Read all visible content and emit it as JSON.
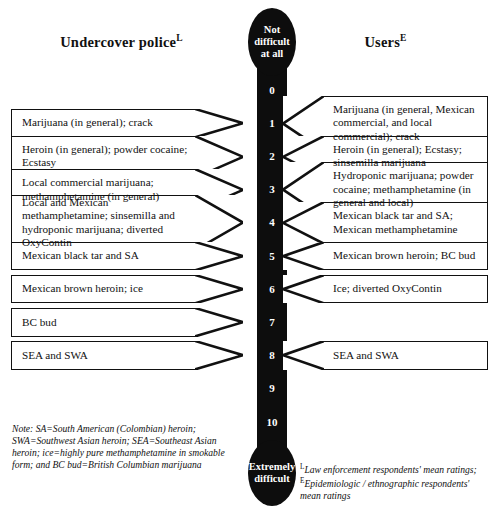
{
  "headers": {
    "left": {
      "label": "Undercover police",
      "superscript": "L"
    },
    "right": {
      "label": "Users",
      "superscript": "E"
    }
  },
  "scale": {
    "top_label": "Not\ndifficult\nat all",
    "top_label_lines": [
      "Not",
      "difficult",
      "at all"
    ],
    "bottom_label_lines": [
      "Extremely",
      "difficult"
    ],
    "ticks": [
      "0",
      "1",
      "2",
      "3",
      "4",
      "5",
      "6",
      "7",
      "8",
      "9",
      "10"
    ],
    "min_value": 0,
    "max_value": 10
  },
  "left_callouts": [
    {
      "level": 1,
      "text": "Marijuana (in general); crack"
    },
    {
      "level": 2,
      "text": "Heroin (in general); powder cocaine; Ecstasy"
    },
    {
      "level": 3,
      "text": "Local commercial marijuana; methamphetamine (in general)"
    },
    {
      "level": 4,
      "text": "Local and Mexican methamphetamine; sinsemilla and hydroponic marijuana; diverted OxyContin"
    },
    {
      "level": 5,
      "text": "Mexican black tar and SA"
    },
    {
      "level": 6,
      "text": "Mexican brown heroin; ice"
    },
    {
      "level": 7,
      "text": "BC bud"
    },
    {
      "level": 8,
      "text": "SEA and SWA"
    }
  ],
  "right_callouts": [
    {
      "level": 1,
      "text": "Marijuana (in general, Mexican commercial, and local commercial); crack"
    },
    {
      "level": 2,
      "text": "Heroin (in general); Ecstasy; sinsemilla marijuana"
    },
    {
      "level": 3,
      "text": "Hydroponic marijuana; powder cocaine; methamphetamine (in general and local)"
    },
    {
      "level": 4,
      "text": "Mexican black tar and SA; Mexican methamphetamine"
    },
    {
      "level": 5,
      "text": "Mexican brown heroin; BC bud"
    },
    {
      "level": 6,
      "text": "Ice; diverted OxyContin"
    },
    {
      "level": 8,
      "text": "SEA and SWA"
    }
  ],
  "footnotes": {
    "left": "Note: SA=South American (Colombian) heroin; SWA=Southwest Asian heroin; SEA=Southeast Asian heroin; ice=highly pure methamphetamine in smokable form; and BC bud=British Columbian marijuana",
    "right_sup_1": "L",
    "right_part_1": "Law enforcement respondents' mean ratings; ",
    "right_sup_2": "E",
    "right_part_2": "Epidemiologic / ethnographic respondents' mean ratings"
  },
  "chart_data": {
    "type": "table",
    "xlabel": "",
    "ylabel": "Difficulty rating",
    "ylim": [
      0,
      10
    ],
    "grid": false,
    "legend_position": "top",
    "categories": [
      "0",
      "1",
      "2",
      "3",
      "4",
      "5",
      "6",
      "7",
      "8",
      "9",
      "10"
    ],
    "series": [
      {
        "name": "Undercover police",
        "legend": "Undercover police (L)",
        "points": [
          {
            "value": 1,
            "label": "Marijuana (in general); crack"
          },
          {
            "value": 2,
            "label": "Heroin (in general); powder cocaine; Ecstasy"
          },
          {
            "value": 3,
            "label": "Local commercial marijuana; methamphetamine (in general)"
          },
          {
            "value": 4,
            "label": "Local and Mexican methamphetamine; sinsemilla and hydroponic marijuana; diverted OxyContin"
          },
          {
            "value": 5,
            "label": "Mexican black tar and SA"
          },
          {
            "value": 6,
            "label": "Mexican brown heroin; ice"
          },
          {
            "value": 7,
            "label": "BC bud"
          },
          {
            "value": 8,
            "label": "SEA and SWA"
          }
        ]
      },
      {
        "name": "Users",
        "legend": "Users (E)",
        "points": [
          {
            "value": 1,
            "label": "Marijuana (in general, Mexican commercial, and local commercial); crack"
          },
          {
            "value": 2,
            "label": "Heroin (in general); Ecstasy; sinsemilla marijuana"
          },
          {
            "value": 3,
            "label": "Hydroponic marijuana; powder cocaine; methamphetamine (in general and local)"
          },
          {
            "value": 4,
            "label": "Mexican black tar and SA; Mexican methamphetamine"
          },
          {
            "value": 5,
            "label": "Mexican brown heroin; BC bud"
          },
          {
            "value": 6,
            "label": "Ice; diverted OxyContin"
          },
          {
            "value": 8,
            "label": "SEA and SWA"
          }
        ]
      }
    ],
    "annotations": [
      "Not difficult at all",
      "Extremely difficult"
    ]
  },
  "colors": {
    "scale_fill": "#0d0d0d",
    "scale_text": "#ffffff",
    "outline": "#111111",
    "background": "#ffffff"
  }
}
